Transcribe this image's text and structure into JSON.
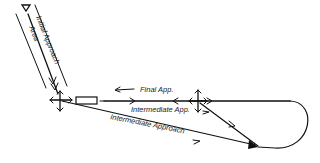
{
  "diagram": {
    "labels": {
      "initial_approach": "Initial Approach",
      "area": "Area",
      "final_app": "Final App.",
      "intermediate_app": "Intermediate App.",
      "intermediate_approach": "Intermediate Approach"
    },
    "colors": {
      "ink": "#111111",
      "background": "#ffffff"
    }
  }
}
